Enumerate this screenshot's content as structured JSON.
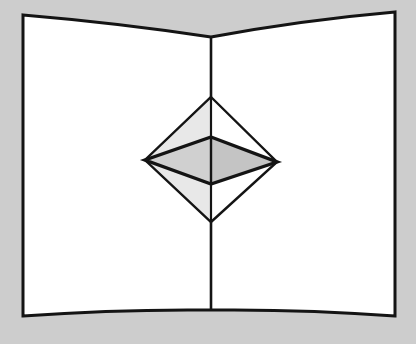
{
  "figure": {
    "caption": "",
    "width": 416,
    "height": 344,
    "background_color": "#cdcdcd",
    "paper_color": "#ffffff",
    "stroke_color": "#141414",
    "shade_light_color": "#e8e8e8",
    "shade_mid_color": "#d0d0d0",
    "shade_dark_color": "#c4c4c4"
  },
  "geometry": {
    "card": {
      "name": "open-card",
      "top_left": [
        23,
        15
      ],
      "top_right": [
        395,
        12
      ],
      "bottom_right": [
        395,
        316
      ],
      "bottom_left": [
        23,
        316
      ],
      "spine_top": [
        211,
        37
      ],
      "spine_bottom": [
        211,
        310
      ],
      "top_edge_curve_control_left": [
        118,
        23
      ],
      "top_edge_curve_control_right": [
        303,
        20
      ],
      "bottom_edge_curve_control_left": [
        118,
        309
      ],
      "bottom_edge_curve_control_right": [
        303,
        309
      ]
    },
    "popup": {
      "name": "diamond-popup",
      "apex_top": [
        211,
        97
      ],
      "apex_bottom": [
        211,
        222
      ],
      "vertex_left": [
        145,
        160
      ],
      "vertex_right": [
        277,
        162
      ],
      "center_top": [
        211,
        137
      ],
      "center_bottom": [
        211,
        184
      ],
      "faces": [
        {
          "name": "upper-left-face",
          "points": "211,97 145,160 211,137",
          "shade": "shade_light_color"
        },
        {
          "name": "upper-right-face",
          "points": "211,97 277,162 211,137",
          "shade": "paper_color"
        },
        {
          "name": "lower-left-face",
          "points": "211,222 145,160 211,184",
          "shade": "shade_light_color"
        },
        {
          "name": "lower-right-face",
          "points": "211,222 277,162 211,184",
          "shade": "paper_color"
        },
        {
          "name": "inner-left-panel",
          "points": "145,160 211,137 211,184",
          "shade": "shade_mid_color"
        },
        {
          "name": "inner-right-panel",
          "points": "277,162 211,137 211,184",
          "shade": "shade_dark_color"
        }
      ]
    }
  },
  "labels": {
    "none": ""
  }
}
